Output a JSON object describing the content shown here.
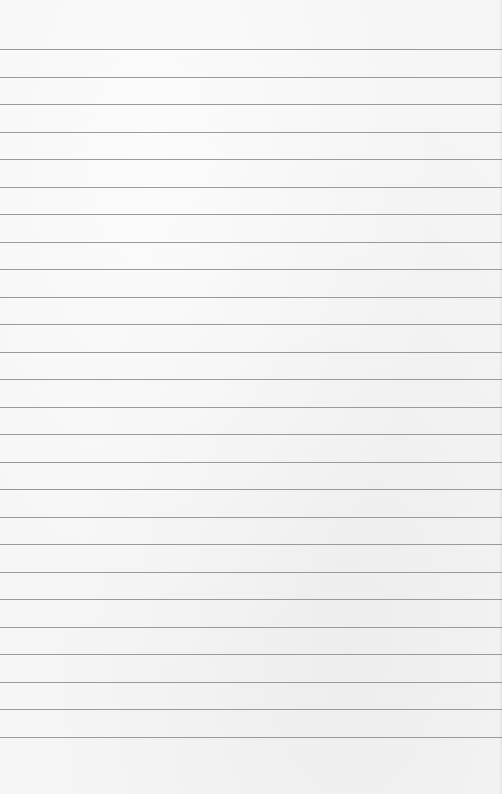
{
  "page": {
    "type": "lined-paper",
    "background_color": "#f5f5f5",
    "rule_color": "#9a9a9a",
    "first_rule_y": 49,
    "rule_spacing": 27.5,
    "rule_count": 26,
    "text_lines": []
  }
}
